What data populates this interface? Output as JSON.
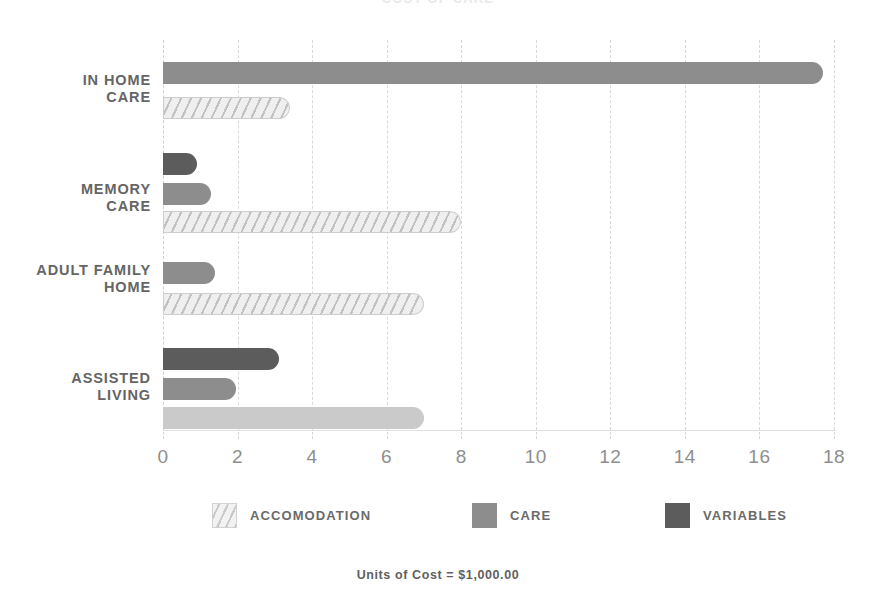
{
  "chart_data": {
    "type": "bar",
    "orientation": "horizontal",
    "title": "COST OF CARE",
    "xlabel": "",
    "ylabel": "",
    "xlim": [
      0,
      18
    ],
    "grid": true,
    "grid_axis": "x",
    "legend_position": "bottom",
    "footnote": "Units of Cost = $1,000.00",
    "xticks": [
      "0",
      "2",
      "4",
      "6",
      "8",
      "10",
      "12",
      "14",
      "16",
      "18"
    ],
    "xtick_values": [
      0,
      2,
      4,
      6,
      8,
      10,
      12,
      14,
      16,
      18
    ],
    "categories": [
      "IN HOME\nCARE",
      "MEMORY\nCARE",
      "ADULT FAMILY\nHOME",
      "ASSISTED\nLIVING"
    ],
    "series": [
      {
        "name": "ACCOMODATION",
        "color": "#efefef",
        "pattern": "diagonal-hatch",
        "values": [
          3.4,
          8.0,
          7.0,
          7.0
        ]
      },
      {
        "name": "CARE",
        "color": "#8d8d8d",
        "pattern": "solid",
        "values": [
          17.7,
          1.3,
          1.4,
          1.95
        ]
      },
      {
        "name": "VARIABLES",
        "color": "#5c5c5c",
        "pattern": "solid",
        "values": [
          null,
          0.9,
          null,
          3.1
        ]
      }
    ],
    "groups": [
      {
        "label": "IN HOME\nCARE",
        "label_y": 72,
        "bars": [
          {
            "series": "CARE",
            "value": 17.7,
            "y": 62,
            "style": "care"
          },
          {
            "series": "ACCOMODATION",
            "value": 3.4,
            "y": 97,
            "style": "accom"
          }
        ]
      },
      {
        "label": "MEMORY\nCARE",
        "label_y": 181,
        "bars": [
          {
            "series": "VARIABLES",
            "value": 0.9,
            "y": 153,
            "style": "variables"
          },
          {
            "series": "CARE",
            "value": 1.3,
            "y": 183,
            "style": "care"
          },
          {
            "series": "ACCOMODATION",
            "value": 8.0,
            "y": 211,
            "style": "accom"
          }
        ]
      },
      {
        "label": "ADULT FAMILY\nHOME",
        "label_y": 262,
        "bars": [
          {
            "series": "CARE",
            "value": 1.4,
            "y": 262,
            "style": "care"
          },
          {
            "series": "ACCOMODATION",
            "value": 7.0,
            "y": 293,
            "style": "accom"
          }
        ]
      },
      {
        "label": "ASSISTED\nLIVING",
        "label_y": 370,
        "bars": [
          {
            "series": "VARIABLES",
            "value": 3.1,
            "y": 348,
            "style": "variables"
          },
          {
            "series": "CARE",
            "value": 1.95,
            "y": 378,
            "style": "care"
          },
          {
            "series": "ACCOMODATION",
            "value": 7.0,
            "y": 407,
            "style": "accom-solid"
          }
        ]
      }
    ]
  },
  "legend": {
    "items": [
      {
        "label": "ACCOMODATION",
        "style": "accom",
        "x": 212
      },
      {
        "label": "CARE",
        "style": "care",
        "x": 472
      },
      {
        "label": "VARIABLES",
        "style": "variables",
        "x": 665
      }
    ]
  },
  "footer": {
    "note": "Units of Cost = $1,000.00"
  }
}
